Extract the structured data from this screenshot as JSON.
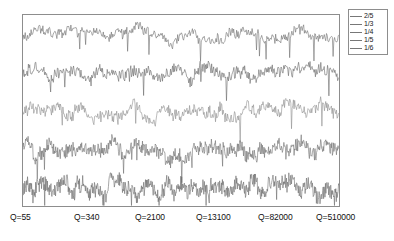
{
  "chart_data": {
    "type": "line",
    "title": "",
    "xlabel": "",
    "ylabel": "",
    "grid": false,
    "legend_position": "top-right",
    "x_tick_labels": [
      "Q=55",
      "Q=340",
      "Q=2100",
      "Q=13100",
      "Q=82000",
      "Q=510000"
    ],
    "x_tick_values": [
      55,
      340,
      2100,
      13100,
      82000,
      510000
    ],
    "xlim": [
      55,
      510000
    ],
    "ylim": [
      0,
      5
    ],
    "note": "Five vertically offset noisy signal traces, one per legend entry; each trace is stacked in its own horizontal band.",
    "series": [
      {
        "name": "2/5",
        "color": "#6e6e6e",
        "band_index": 0,
        "baseline": 4.5,
        "amplitude": 0.42,
        "roughness": 0.55,
        "samples": 430,
        "seed": 11
      },
      {
        "name": "1/3",
        "color": "#6a6a6a",
        "band_index": 1,
        "baseline": 3.5,
        "amplitude": 0.44,
        "roughness": 0.6,
        "samples": 470,
        "seed": 23
      },
      {
        "name": "1/4",
        "color": "#8e8e8e",
        "band_index": 2,
        "baseline": 2.5,
        "amplitude": 0.46,
        "roughness": 0.62,
        "samples": 500,
        "seed": 37
      },
      {
        "name": "1/5",
        "color": "#707070",
        "band_index": 3,
        "baseline": 1.5,
        "amplitude": 0.45,
        "roughness": 0.78,
        "samples": 620,
        "seed": 53
      },
      {
        "name": "1/6",
        "color": "#6c6c6c",
        "band_index": 4,
        "baseline": 0.5,
        "amplitude": 0.47,
        "roughness": 0.85,
        "samples": 700,
        "seed": 71
      }
    ]
  },
  "legend": {
    "items": [
      {
        "label": "2/5"
      },
      {
        "label": "1/3"
      },
      {
        "label": "1/4"
      },
      {
        "label": "1/5"
      },
      {
        "label": "1/6"
      }
    ]
  },
  "axis": {
    "ticks": [
      {
        "label": "Q=55"
      },
      {
        "label": "Q=340"
      },
      {
        "label": "Q=2100"
      },
      {
        "label": "Q=13100"
      },
      {
        "label": "Q=82000"
      },
      {
        "label": "Q=510000"
      }
    ]
  },
  "colors": {
    "frame": "#8d8d8d",
    "text": "#111111",
    "background": "#ffffff"
  }
}
